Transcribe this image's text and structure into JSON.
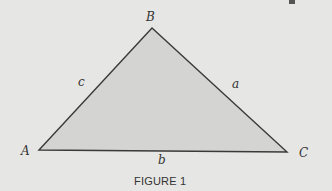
{
  "figure": {
    "caption": "FIGURE 1",
    "shape": "triangle",
    "colors": {
      "background": "#e6e6e4",
      "fill": "#d4d4d2",
      "stroke": "#3a3a3a",
      "text": "#333333"
    },
    "vertices": [
      {
        "name": "A",
        "x": 39,
        "y": 150
      },
      {
        "name": "B",
        "x": 152,
        "y": 28
      },
      {
        "name": "C",
        "x": 287,
        "y": 152
      }
    ],
    "sides": [
      {
        "name": "c",
        "between": "A-B"
      },
      {
        "name": "a",
        "between": "B-C"
      },
      {
        "name": "b",
        "between": "A-C"
      }
    ]
  }
}
